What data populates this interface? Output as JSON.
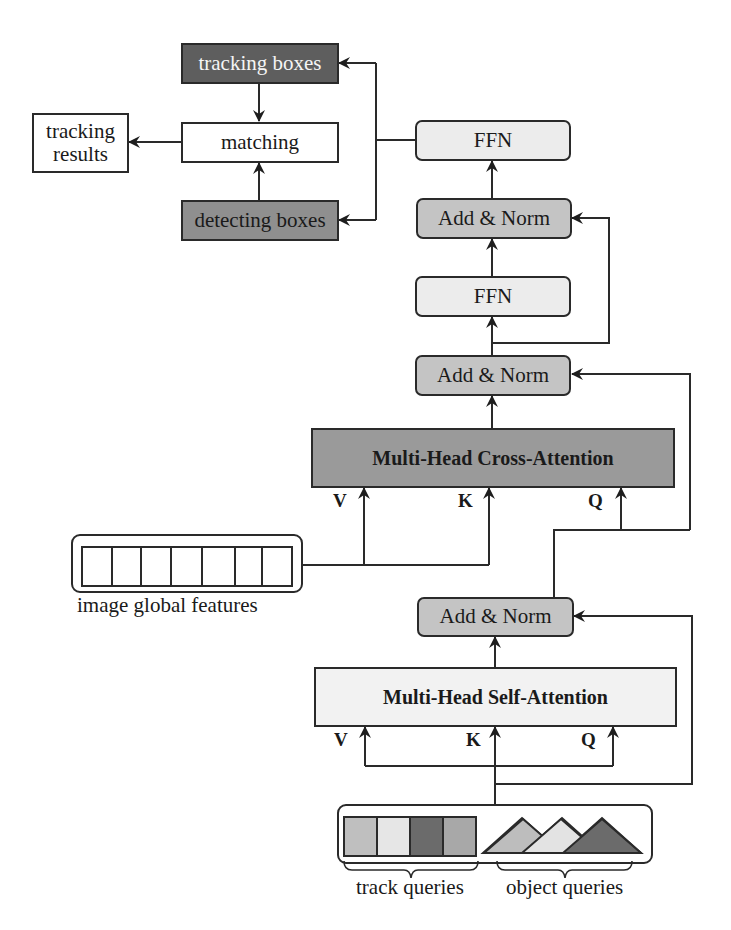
{
  "diagram": {
    "colors": {
      "tracking_boxes_fill": "#5e5e5e",
      "detecting_boxes_fill": "#8f8f8f",
      "add_norm_fill": "#c4c4c4",
      "ffn_fill": "#ececec",
      "cross_attention_fill": "#9a9a9a",
      "self_attention_fill": "#f2f2f2",
      "line": "#2a2a2a"
    },
    "nodes": {
      "tracking_boxes": "tracking boxes",
      "matching": "matching",
      "tracking_results": "tracking\nresults",
      "detecting_boxes": "detecting boxes",
      "ffn_top": "FFN",
      "add_norm_top": "Add & Norm",
      "ffn_mid": "FFN",
      "add_norm_mid": "Add & Norm",
      "cross_attention": "Multi-Head Cross-Attention",
      "add_norm_bottom": "Add & Norm",
      "self_attention": "Multi-Head Self-Attention",
      "image_global_features": "image global features",
      "track_queries": "track queries",
      "object_queries": "object queries"
    },
    "cross_attention_inputs": {
      "v": "V",
      "k": "K",
      "q": "Q"
    },
    "self_attention_inputs": {
      "v": "V",
      "k": "K",
      "q": "Q"
    },
    "image_feature_cells": 7,
    "track_query_colors": [
      "#bfbfbf",
      "#e6e6e6",
      "#6b6b6b",
      "#a8a8a8"
    ],
    "object_query_colors": [
      "#bdbdbd",
      "#e3e3e3",
      "#6b6b6b",
      "#a8a8a8"
    ],
    "edges": [
      {
        "from": "self_attention",
        "to": "add_norm_bottom"
      },
      {
        "from": "queries",
        "to": "self_attention",
        "ports": [
          "V",
          "K",
          "Q"
        ]
      },
      {
        "from": "queries",
        "to": "add_norm_bottom",
        "type": "residual"
      },
      {
        "from": "add_norm_bottom",
        "to": "cross_attention",
        "port": "Q"
      },
      {
        "from": "add_norm_bottom",
        "to": "add_norm_mid",
        "type": "residual"
      },
      {
        "from": "image_global_features",
        "to": "cross_attention",
        "ports": [
          "V",
          "K"
        ]
      },
      {
        "from": "cross_attention",
        "to": "add_norm_mid"
      },
      {
        "from": "add_norm_mid",
        "to": "ffn_mid"
      },
      {
        "from": "add_norm_mid",
        "to": "add_norm_top",
        "type": "residual"
      },
      {
        "from": "ffn_mid",
        "to": "add_norm_top"
      },
      {
        "from": "add_norm_top",
        "to": "ffn_top"
      },
      {
        "from": "ffn_top",
        "to": "tracking_boxes"
      },
      {
        "from": "ffn_top",
        "to": "detecting_boxes"
      },
      {
        "from": "tracking_boxes",
        "to": "matching"
      },
      {
        "from": "detecting_boxes",
        "to": "matching"
      },
      {
        "from": "matching",
        "to": "tracking_results"
      }
    ]
  }
}
